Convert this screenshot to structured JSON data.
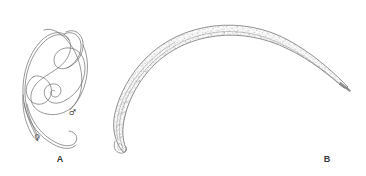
{
  "figure": {
    "background_color": "#ffffff",
    "ink_color": "#5a5a5a",
    "caption_color": "#3a3a3a",
    "width": 366,
    "height": 176
  },
  "panels": [
    {
      "id": "A",
      "caption": "A",
      "subject": "pair-of-coiled-worms",
      "description": "Line drawing of two slender intertwined nematodes, a coiled male and a larger looping female, drawn in thin grey outline",
      "annotations": [
        {
          "symbol": "♂",
          "name": "male-symbol",
          "meaning": "male",
          "x": 72,
          "y": 113
        },
        {
          "symbol": "♀",
          "name": "female-symbol",
          "meaning": "female",
          "x": 37,
          "y": 138
        }
      ]
    },
    {
      "id": "B",
      "caption": "B",
      "subject": "single-arched-worm",
      "description": "Line drawing of a single large arched nematode shown in lateral view with a stippled granular internal body texture, blunt anterior end at lower left and a tapering pointed posterior end at right",
      "annotations": []
    }
  ],
  "captions": {
    "panel_a_label": "A",
    "panel_b_label": "B"
  }
}
